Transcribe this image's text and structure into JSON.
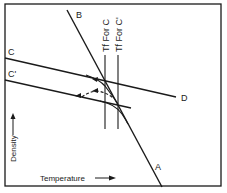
{
  "diagram": {
    "type": "density-temperature schematic",
    "axes": {
      "x_label": "Temperature",
      "y_label": "Density"
    },
    "lines": {
      "A": "A",
      "B": "B",
      "C": "C",
      "C_prime": "C'",
      "D": "D"
    },
    "markers": {
      "tf_c": "Tf For C",
      "tf_c_prime": "Tf For C'"
    },
    "colors": {
      "ink": "#1a1a1a",
      "background": "#ffffff"
    }
  }
}
